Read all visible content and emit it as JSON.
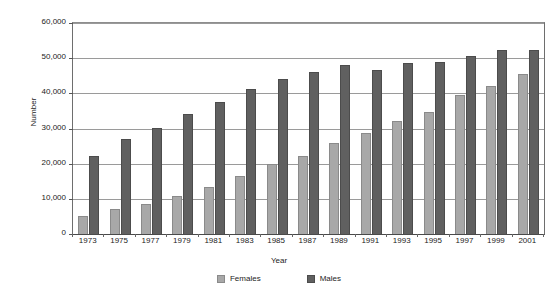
{
  "chart_data": {
    "type": "bar",
    "title": "",
    "xlabel": "Year",
    "ylabel": "Number",
    "categories": [
      "1973",
      "1975",
      "1977",
      "1979",
      "1981",
      "1983",
      "1985",
      "1987",
      "1989",
      "1991",
      "1993",
      "1995",
      "1997",
      "1999",
      "2001"
    ],
    "series": [
      {
        "name": "Females",
        "color": "#a8a8a8",
        "values": [
          5000,
          7000,
          8500,
          10800,
          13500,
          16500,
          19800,
          22300,
          26000,
          28800,
          32200,
          34600,
          39400,
          42200,
          45500
        ]
      },
      {
        "name": "Males",
        "color": "#606060",
        "values": [
          22200,
          26900,
          30200,
          34200,
          37500,
          41300,
          44000,
          46000,
          48000,
          46500,
          48500,
          48800,
          50600,
          52200,
          52200
        ]
      }
    ],
    "ylim": [
      0,
      60000
    ],
    "ytick_values": [
      0,
      10000,
      20000,
      30000,
      40000,
      50000,
      60000
    ],
    "ytick_labels": [
      "0",
      "10,000",
      "20,000",
      "30,000",
      "40,000",
      "50,000",
      "60,000"
    ],
    "grid": true,
    "legend_position": "bottom",
    "legend_entries": [
      "Females",
      "Males"
    ]
  }
}
